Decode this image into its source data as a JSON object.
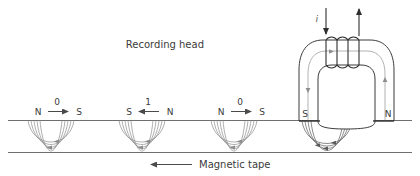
{
  "figure": {
    "title_label": "Recording head",
    "tape_label": "Magnetic tape",
    "current_label": "i"
  },
  "head": {
    "pole_left": "S",
    "pole_right": "N",
    "coil_turns": 4,
    "lead_in_direction": "down",
    "lead_out_direction": "up"
  },
  "tape": {
    "travel_direction": "left",
    "segments": [
      {
        "bit": "0",
        "left_pole": "N",
        "right_pole": "S",
        "arrow": "right"
      },
      {
        "bit": "1",
        "left_pole": "S",
        "right_pole": "N",
        "arrow": "left"
      },
      {
        "bit": "0",
        "left_pole": "N",
        "right_pole": "S",
        "arrow": "right"
      },
      {
        "bit": "",
        "left_pole": "S",
        "right_pole": "N",
        "arrow": "none"
      }
    ]
  },
  "colors": {
    "ink": "#3b3b3b",
    "line": "#6f6f6f",
    "flux": "#8d8d8d",
    "background": "#ffffff"
  }
}
